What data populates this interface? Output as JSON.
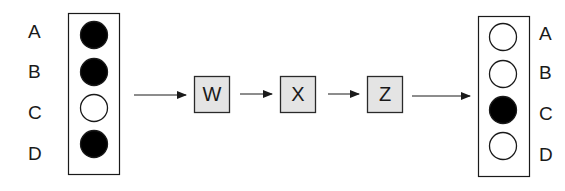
{
  "diagram": {
    "colors": {
      "stroke": "#1a1a1a",
      "filled": "#000000",
      "empty": "#ffffff",
      "process_box_fill": "#e4e4e4"
    },
    "input": {
      "labels": [
        "A",
        "B",
        "C",
        "D"
      ],
      "states": [
        "filled",
        "filled",
        "empty",
        "filled"
      ]
    },
    "processes": [
      {
        "label": "W"
      },
      {
        "label": "X"
      },
      {
        "label": "Z"
      }
    ],
    "output": {
      "labels": [
        "A",
        "B",
        "C",
        "D"
      ],
      "states": [
        "empty",
        "empty",
        "filled",
        "empty"
      ]
    }
  }
}
